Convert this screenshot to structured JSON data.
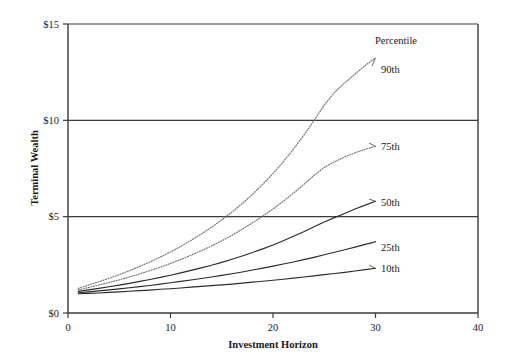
{
  "chart_data": {
    "type": "line",
    "title": "",
    "xlabel": "Investment Horizon",
    "ylabel": "Terminal Wealth",
    "xlim": [
      0,
      40
    ],
    "ylim": [
      0,
      15
    ],
    "xticks": [
      0,
      10,
      20,
      30,
      40
    ],
    "xtick_labels": [
      "0",
      "10",
      "20",
      "30",
      "40"
    ],
    "yticks": [
      0,
      5,
      10,
      15
    ],
    "ytick_labels": [
      "$0",
      "$5",
      "$10",
      "$15"
    ],
    "grid": "horizontal-at-y-ticks",
    "legend_title": "Percentile",
    "legend_position": "inline-right-of-curve-ends",
    "x": [
      1,
      2,
      3,
      4,
      5,
      6,
      7,
      8,
      9,
      10,
      11,
      12,
      13,
      14,
      15,
      16,
      17,
      18,
      19,
      20,
      21,
      22,
      23,
      24,
      25,
      26,
      27,
      28,
      29,
      30
    ],
    "series": [
      {
        "name": "90th",
        "label": "90th",
        "style": "dotted",
        "values": [
          1.28,
          1.45,
          1.62,
          1.8,
          1.99,
          2.2,
          2.42,
          2.65,
          2.9,
          3.17,
          3.46,
          3.77,
          4.1,
          4.45,
          4.83,
          5.24,
          5.68,
          6.16,
          6.68,
          7.24,
          7.85,
          8.51,
          9.22,
          9.98,
          10.8,
          11.45,
          11.95,
          12.4,
          12.85,
          13.25
        ]
      },
      {
        "name": "75th",
        "label": "75th",
        "style": "dotted",
        "values": [
          1.2,
          1.32,
          1.45,
          1.58,
          1.72,
          1.87,
          2.03,
          2.2,
          2.38,
          2.57,
          2.78,
          3.0,
          3.23,
          3.48,
          3.75,
          4.04,
          4.35,
          4.68,
          5.03,
          5.4,
          5.8,
          6.22,
          6.67,
          7.14,
          7.55,
          7.85,
          8.1,
          8.32,
          8.5,
          8.65
        ]
      },
      {
        "name": "50th",
        "label": "50th",
        "style": "solid",
        "values": [
          1.12,
          1.2,
          1.28,
          1.36,
          1.45,
          1.54,
          1.64,
          1.74,
          1.85,
          1.96,
          2.08,
          2.21,
          2.34,
          2.48,
          2.63,
          2.79,
          2.96,
          3.14,
          3.33,
          3.53,
          3.75,
          3.98,
          4.22,
          4.48,
          4.72,
          4.95,
          5.16,
          5.4,
          5.6,
          5.8
        ]
      },
      {
        "name": "25th",
        "label": "25th",
        "style": "solid",
        "values": [
          1.05,
          1.1,
          1.15,
          1.2,
          1.25,
          1.31,
          1.37,
          1.43,
          1.5,
          1.57,
          1.64,
          1.71,
          1.79,
          1.87,
          1.95,
          2.04,
          2.13,
          2.23,
          2.33,
          2.43,
          2.54,
          2.65,
          2.77,
          2.89,
          3.02,
          3.15,
          3.28,
          3.42,
          3.56,
          3.7
        ]
      },
      {
        "name": "10th",
        "label": "10th",
        "style": "solid",
        "values": [
          1.0,
          1.02,
          1.04,
          1.07,
          1.1,
          1.13,
          1.16,
          1.19,
          1.23,
          1.26,
          1.3,
          1.34,
          1.38,
          1.42,
          1.46,
          1.5,
          1.55,
          1.6,
          1.65,
          1.7,
          1.75,
          1.81,
          1.87,
          1.93,
          1.99,
          2.05,
          2.11,
          2.18,
          2.25,
          2.32
        ]
      }
    ]
  },
  "axis": {
    "x_title": "Investment Horizon",
    "y_title": "Terminal Wealth"
  },
  "legend": {
    "title": "Percentile"
  },
  "colors": {
    "axis": "#3a3a3a",
    "solid_series": "#2b2b2b",
    "dotted_series": "#6e6e6e",
    "background": "#ffffff"
  }
}
